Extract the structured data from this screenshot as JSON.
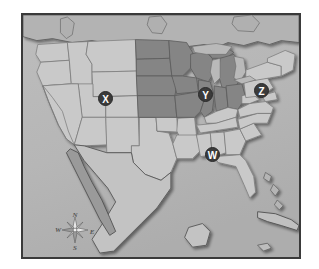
{
  "image": {
    "kind": "reference-map",
    "subject": "United States map with four labeled point markers",
    "width": 319,
    "height": 269,
    "background_color": "#ffffff",
    "frame_color": "#3a3a3a"
  },
  "map": {
    "ocean_color": "#b9b9b9",
    "land_unshaded_color": "#c9c9c9",
    "land_shaded_color": "#858585",
    "foreign_land_color": "#b0b0b0",
    "border_line_color": "#6e6e6e",
    "coast_line_color": "#4a4a4a",
    "shaded_region_name": "Midwest",
    "shaded_states": [
      "North Dakota",
      "South Dakota",
      "Nebraska",
      "Kansas",
      "Minnesota",
      "Iowa",
      "Missouri",
      "Wisconsin",
      "Illinois",
      "Indiana",
      "Michigan",
      "Ohio"
    ]
  },
  "markers": [
    {
      "id": "marker-x",
      "label": "X",
      "x": 96,
      "y": 89,
      "region": "Utah / Colorado border"
    },
    {
      "id": "marker-y",
      "label": "Y",
      "x": 196,
      "y": 85,
      "region": "Illinois"
    },
    {
      "id": "marker-z",
      "label": "Z",
      "x": 252,
      "y": 81,
      "region": "Pennsylvania"
    },
    {
      "id": "marker-w",
      "label": "W",
      "x": 203,
      "y": 145,
      "region": "Alabama"
    }
  ],
  "compass": {
    "north": "N",
    "west": "W",
    "east": "E",
    "south": "S"
  }
}
